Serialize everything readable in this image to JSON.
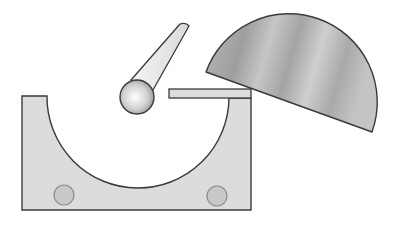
{
  "diagram": {
    "title": "",
    "colors": {
      "background": "#ffffff",
      "block_fill": "#dcdcdc",
      "outline": "#3a3a3a",
      "ball_light": "#ffffff",
      "ball_dark": "#9a9a9a",
      "half_disk_light": "#d8d8d8",
      "half_disk_dark": "#9c9c9c",
      "hole_fill": "#c8c8c8",
      "hole_stroke": "#8a8a8a"
    },
    "components": [
      {
        "name": "block-with-groove",
        "label": ""
      },
      {
        "name": "pendulum-rod",
        "label": ""
      },
      {
        "name": "ball",
        "label": ""
      },
      {
        "name": "platform",
        "label": ""
      },
      {
        "name": "half-disk",
        "label": ""
      },
      {
        "name": "hole-left",
        "label": ""
      },
      {
        "name": "hole-right",
        "label": ""
      }
    ]
  }
}
